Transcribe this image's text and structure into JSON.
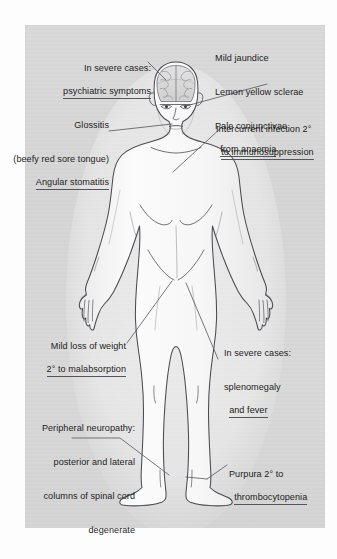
{
  "diagram": {
    "panel_color": "#d7d7d7",
    "outline_color": "#4a4a52",
    "text_color": "#1d1d22",
    "leader_color": "#55555c"
  },
  "labels": [
    {
      "id": "psychiatric-symptoms",
      "align": "right",
      "lines": [
        "In severe cases:",
        "psychiatric symptoms"
      ],
      "underlined_line_index": 1,
      "points_to": "brain"
    },
    {
      "id": "ocular-signs",
      "align": "left",
      "lines": [
        "Mild jaundice",
        "Lemon yellow sclerae",
        "Pale conjunctivae",
        "from anaemia"
      ],
      "underlined_line_index": 3,
      "points_to": "eyes"
    },
    {
      "id": "glossitis",
      "align": "right",
      "lines": [
        "Glossitis",
        "(beefy red sore tongue)",
        "Angular stomatitis"
      ],
      "underlined_line_index": 2,
      "points_to": "mouth"
    },
    {
      "id": "intercurrent-infection",
      "align": "left",
      "lines": [
        "Intercurrent infection 2°",
        "to immunosuppression"
      ],
      "underlined_line_index": 1,
      "points_to": "chest"
    },
    {
      "id": "weight-loss",
      "align": "right",
      "lines": [
        "Mild loss of weight",
        "2° to malabsorption"
      ],
      "underlined_line_index": 1,
      "points_to": "abdomen"
    },
    {
      "id": "splenomegaly",
      "align": "left",
      "lines": [
        "In severe cases:",
        "splenomegaly",
        "and fever"
      ],
      "underlined_line_index": 2,
      "points_to": "left-upper-abdomen"
    },
    {
      "id": "peripheral-neuropathy",
      "align": "right",
      "lines": [
        "Peripheral neuropathy:",
        "posterior and lateral",
        "columns of spinal cord",
        "degenerate"
      ],
      "underlined_line_index": -1,
      "points_to": "lower-leg-right"
    },
    {
      "id": "purpura",
      "align": "left",
      "lines": [
        "Purpura 2° to",
        "thrombocytopenia"
      ],
      "underlined_line_index": 1,
      "points_to": "lower-leg-left"
    }
  ]
}
